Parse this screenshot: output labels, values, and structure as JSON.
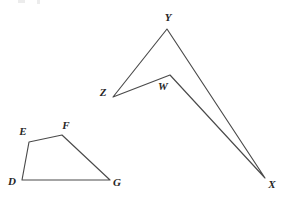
{
  "canvas": {
    "width": 290,
    "height": 200,
    "background": "#ffffff",
    "stroke_color": "#4a4a4a",
    "label_color": "#262626"
  },
  "figures": [
    {
      "id": "quadrilateral-defg",
      "name": "Quadrilateral DEFG",
      "closed": true,
      "vertices": [
        {
          "label": "D",
          "x": 22,
          "y": 180,
          "label_x": 12,
          "label_y": 181
        },
        {
          "label": "E",
          "x": 29,
          "y": 142,
          "label_x": 23,
          "label_y": 131
        },
        {
          "label": "F",
          "x": 62,
          "y": 135,
          "label_x": 66,
          "label_y": 125
        },
        {
          "label": "G",
          "x": 110,
          "y": 180,
          "label_x": 117,
          "label_y": 182
        }
      ]
    },
    {
      "id": "quadrilateral-wxyz",
      "name": "Quadrilateral WXYZ",
      "closed": true,
      "vertices": [
        {
          "label": "W",
          "x": 170,
          "y": 75,
          "label_x": 163,
          "label_y": 86
        },
        {
          "label": "X",
          "x": 265,
          "y": 178,
          "label_x": 272,
          "label_y": 184
        },
        {
          "label": "Y",
          "x": 167,
          "y": 29,
          "label_x": 168,
          "label_y": 17
        },
        {
          "label": "Z",
          "x": 113,
          "y": 97,
          "label_x": 103,
          "label_y": 92
        }
      ]
    }
  ],
  "artifacts": [
    {
      "name": "top-edge-fragment-1",
      "x": 18,
      "y": 0,
      "width": 7,
      "height": 3
    },
    {
      "name": "top-edge-fragment-2",
      "x": 37,
      "y": 0,
      "width": 3,
      "height": 4
    }
  ]
}
